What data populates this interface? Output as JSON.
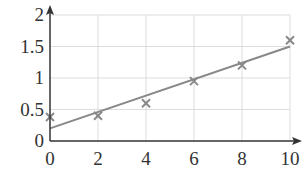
{
  "chart_data": {
    "type": "scatter",
    "title": "",
    "xlabel": "",
    "ylabel": "",
    "xlim": [
      0,
      10
    ],
    "ylim": [
      0,
      2
    ],
    "grid": true,
    "x_ticks": [
      "0",
      "2",
      "4",
      "6",
      "8",
      "10"
    ],
    "y_ticks": [
      "0",
      "0.5",
      "1",
      "1.5",
      "2"
    ],
    "series": [
      {
        "name": "data",
        "marker": "x",
        "x": [
          0,
          2,
          4,
          6,
          8,
          10
        ],
        "y": [
          0.38,
          0.4,
          0.6,
          0.95,
          1.2,
          1.6
        ]
      },
      {
        "name": "line of best fit",
        "type": "line",
        "x": [
          0,
          10
        ],
        "y": [
          0.2,
          1.5
        ]
      }
    ],
    "colors": {
      "axis": "#333333",
      "grid": "#dddddd",
      "series": "#888888"
    }
  }
}
